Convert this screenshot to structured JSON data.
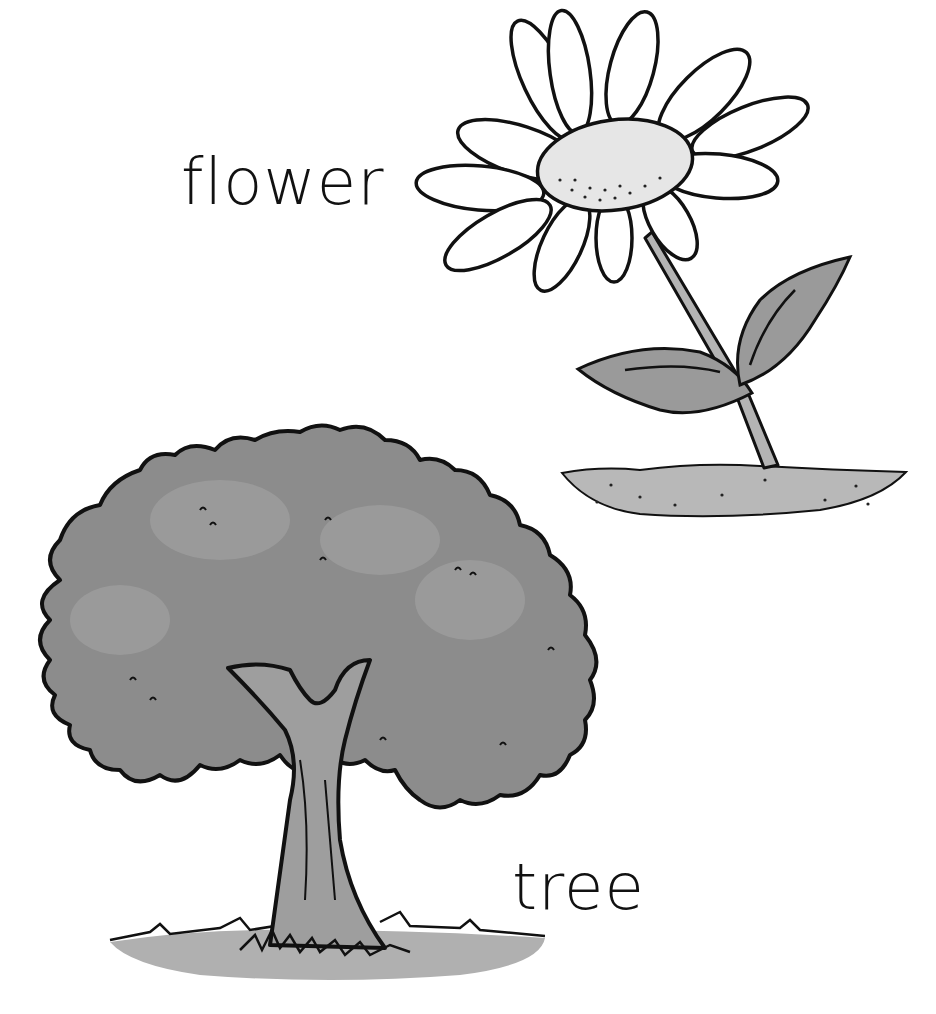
{
  "illustration": {
    "style": "grayscale hand-drawn vocabulary illustration",
    "background": "#ffffff",
    "items": [
      {
        "id": "flower",
        "label": "flower",
        "depicts": "daisy with white petals, pale center, stem with two leaves, patch of soil",
        "colors": {
          "outline": "#111111",
          "petals": "#ffffff",
          "center": "#e6e6e6",
          "leaf": "#9a9a9a",
          "stem": "#b4b4b4",
          "soil": "#b8b8b8"
        }
      },
      {
        "id": "tree",
        "label": "tree",
        "depicts": "leafy deciduous tree with bushy canopy, forked trunk, grass at base",
        "colors": {
          "outline": "#111111",
          "canopy": "#8c8c8c",
          "trunk": "#9e9e9e",
          "grass": "#a8a8a8"
        }
      }
    ]
  }
}
